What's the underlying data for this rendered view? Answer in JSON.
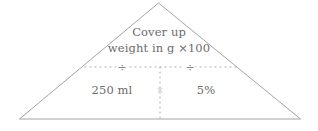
{
  "figure": {
    "name": "dosage-calculation-triangle",
    "shape": "triangle",
    "line_color": "#999999",
    "text_color": "#6b6b6b",
    "background": "#ffffff",
    "top_section": {
      "line1": "Cover up",
      "line2": "weight in g ×100"
    },
    "bottom_left": {
      "value": "250 ml"
    },
    "bottom_right": {
      "value": "5%"
    },
    "operators": {
      "divide_left": "÷",
      "divide_right": "÷",
      "center_multiply": "×"
    },
    "dividers": {
      "horizontal_style": "dotted",
      "vertical_style": "dotted"
    }
  }
}
